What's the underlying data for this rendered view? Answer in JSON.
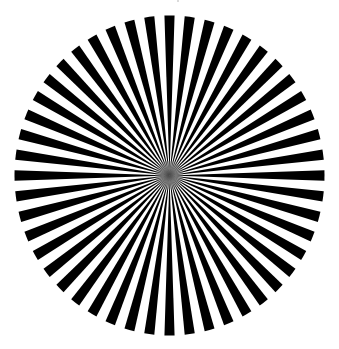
{
  "figure": {
    "type": "siemens-star",
    "spoke_count": 48,
    "first_spoke_angle_deg": -90,
    "center": {
      "x": 169.5,
      "y": 175.5
    },
    "radius": {
      "x": 155,
      "y": 160
    },
    "colors": {
      "spoke": "#000000",
      "background": "#ffffff",
      "center_blur": "#808080"
    }
  }
}
